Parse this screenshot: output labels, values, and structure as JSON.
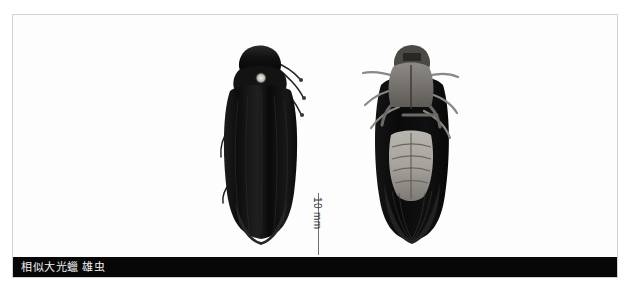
{
  "plate": {
    "background_color": "#ffffff",
    "frame_color": "#d2d2d2"
  },
  "scale": {
    "label": "10 mm",
    "line_color": "#6f6f6f",
    "orientation": "vertical"
  },
  "caption": {
    "text": "相似大光蠟 雄虫",
    "bar_color": "#070707",
    "text_color": "#f2f2f2"
  },
  "specimens": [
    {
      "name": "dorsal-view",
      "view": "dorsal",
      "body_color": "#121212",
      "highlight_color": "#e8e6e2"
    },
    {
      "name": "ventral-view",
      "view": "ventral",
      "body_color": "#1a1a1a",
      "highlight_color": "#c9c6c0"
    }
  ]
}
